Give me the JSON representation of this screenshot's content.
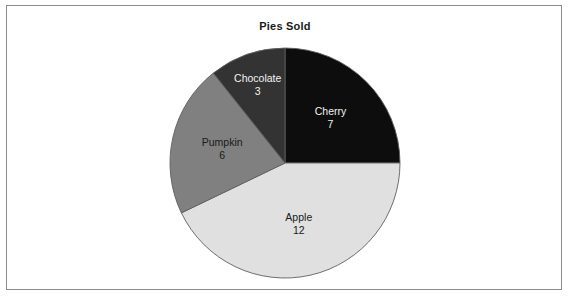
{
  "chart": {
    "title": "Pies Sold",
    "frame_border_color": "#8d8d8d",
    "background_color": "#ffffff"
  },
  "chart_data": {
    "type": "pie",
    "title": "Pies Sold",
    "xlabel": "",
    "ylabel": "",
    "legend": "none",
    "grid": false,
    "total": 28,
    "start_angle_deg": 90,
    "direction": "clockwise",
    "labels_inside_slices": true,
    "categories": [
      "Cherry",
      "Apple",
      "Pumpkin",
      "Chocolate"
    ],
    "values": [
      7,
      12,
      6,
      3
    ],
    "colors": [
      "#0d0d0d",
      "#e0e0e0",
      "#808080",
      "#333333"
    ],
    "slices": [
      {
        "label": "Cherry",
        "value": 7,
        "value_text": "7",
        "color": "#0d0d0d",
        "text_color": "#f2f2f2",
        "share_deg": 90
      },
      {
        "label": "Apple",
        "value": 12,
        "value_text": "12",
        "color": "#e0e0e0",
        "text_color": "#1a1a1a",
        "share_deg": 154.3
      },
      {
        "label": "Pumpkin",
        "value": 6,
        "value_text": "6",
        "color": "#808080",
        "text_color": "#1a1a1a",
        "share_deg": 77.1
      },
      {
        "label": "Chocolate",
        "value": 3,
        "value_text": "3",
        "color": "#333333",
        "text_color": "#f2f2f2",
        "share_deg": 38.6
      }
    ]
  }
}
